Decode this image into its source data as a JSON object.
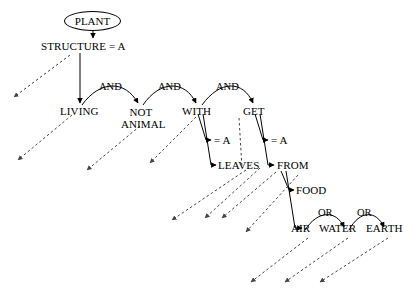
{
  "diagram": {
    "title_node": "PLANT",
    "root_attribute": "STRUCTURE = A",
    "nodes": {
      "plant": "PLANT",
      "structure": "STRUCTURE = A",
      "living": "LIVING",
      "not_animal_line1": "NOT",
      "not_animal_line2": "ANIMAL",
      "with": "WITH",
      "get": "GET",
      "with_eq_a": "= A",
      "get_eq_a": "= A",
      "leaves": "LEAVES",
      "from": "FROM",
      "food": "FOOD",
      "air": "AIR",
      "water": "WATER",
      "earth": "EARTH"
    },
    "connectives": {
      "and_1": "AND",
      "and_2": "AND",
      "and_3": "AND",
      "or_1": "OR",
      "or_2": "OR"
    },
    "colors": {
      "ink": "#000000",
      "paper": "#ffffff",
      "dashed": "#555555"
    }
  }
}
